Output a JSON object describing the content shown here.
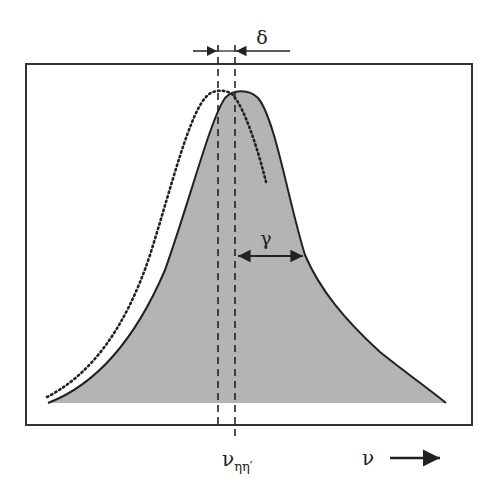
{
  "diagram": {
    "type": "spectral-line-shape",
    "labels": {
      "shift": "δ",
      "halfwidth": "γ",
      "center": "ν",
      "center_subscript": "ηη′",
      "axis": "ν"
    },
    "colors": {
      "fill": "#b3b3b3",
      "line": "#222222",
      "frame": "#333333",
      "background": "#ffffff"
    },
    "frame": {
      "x": 26,
      "y": 64,
      "width": 446,
      "height": 361
    },
    "center_line_x": 235,
    "unperturbed_line_x": 218,
    "peak_y": 92,
    "baseline_y": 403
  }
}
